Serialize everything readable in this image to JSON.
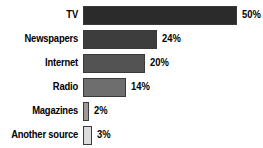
{
  "chart_data": {
    "type": "bar",
    "orientation": "horizontal",
    "title": "",
    "xlabel": "",
    "ylabel": "",
    "xlim": [
      0,
      50
    ],
    "grid": false,
    "legend": "none",
    "value_suffix": "%",
    "categories": [
      "TV",
      "Newspapers",
      "Internet",
      "Radio",
      "Magazines",
      "Another source"
    ],
    "values": [
      50,
      24,
      20,
      14,
      2,
      3
    ],
    "value_labels": [
      "50%",
      "24%",
      "20%",
      "14%",
      "2%",
      "3%"
    ],
    "bar_colors": [
      "#2b2b2b",
      "#3d3d3d",
      "#535353",
      "#6e6e6e",
      "#9a9a9a",
      "#dcdcdc"
    ],
    "bar_border_color": "#3a3a3a",
    "background": "#ffffff",
    "text_color": "#000000",
    "bars": [
      {
        "category": "TV",
        "value": 50,
        "label": "50%",
        "color": "#2b2b2b"
      },
      {
        "category": "Newspapers",
        "value": 24,
        "label": "24%",
        "color": "#3d3d3d"
      },
      {
        "category": "Internet",
        "value": 20,
        "label": "20%",
        "color": "#535353"
      },
      {
        "category": "Radio",
        "value": 14,
        "label": "14%",
        "color": "#6e6e6e"
      },
      {
        "category": "Magazines",
        "value": 2,
        "label": "2%",
        "color": "#9a9a9a"
      },
      {
        "category": "Another source",
        "value": 3,
        "label": "3%",
        "color": "#dcdcdc"
      }
    ]
  }
}
